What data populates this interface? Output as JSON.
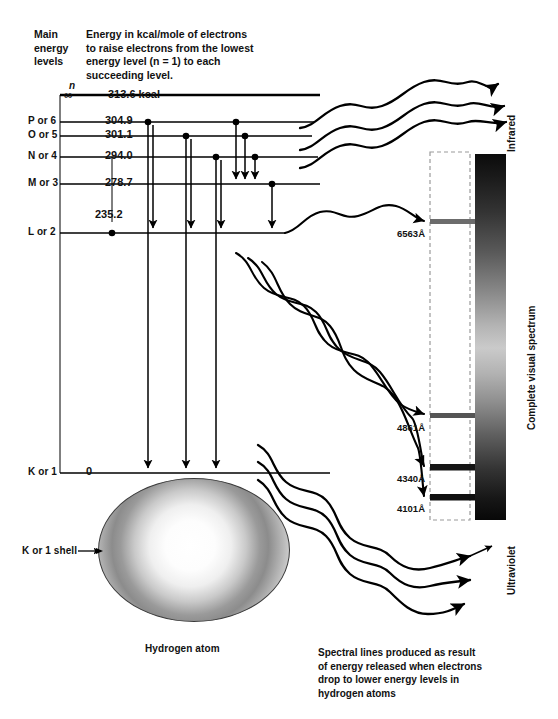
{
  "header": {
    "left_label": "Main\nenergy\nlevels",
    "left_label_lines": [
      "Main",
      "energy",
      "levels"
    ],
    "description_lines": [
      "Energy in kcal/mole of electrons",
      "to raise electrons from the lowest",
      "energy level (n = 1) to each",
      "succeeding level."
    ]
  },
  "levels": [
    {
      "id": "n-infinity",
      "name": "∞",
      "n_symbol": "n",
      "energy": "313.6 kcal",
      "y": 95
    },
    {
      "id": "p-or-6",
      "name": "P or 6",
      "energy": "304.9",
      "y": 122
    },
    {
      "id": "o-or-5",
      "name": "O or 5",
      "energy": "301.1",
      "y": 136
    },
    {
      "id": "n-or-4",
      "name": "N or 4",
      "energy": "294.0",
      "y": 157
    },
    {
      "id": "m-or-3",
      "name": "M or 3",
      "energy": "278.7",
      "y": 184
    },
    {
      "id": "l-or-2",
      "name": "L or 2",
      "energy": "235.2",
      "y": 233
    },
    {
      "id": "k-or-1",
      "name": "K or 1",
      "energy": "0",
      "y": 473
    }
  ],
  "spectral_lines": [
    {
      "label": "6563Å",
      "y": 222,
      "series": "Balmer alpha"
    },
    {
      "label": "4861Å",
      "y": 416,
      "series": "Balmer beta"
    },
    {
      "label": "4340Å",
      "y": 468,
      "series": "Balmer gamma"
    },
    {
      "label": "4101Å",
      "y": 498,
      "series": "Balmer delta"
    }
  ],
  "spectrum": {
    "top_label": "Infrared",
    "bottom_label": "Ultraviolet",
    "side_label": "Complete visual spectrum"
  },
  "atom": {
    "shell_label": "K or 1 shell",
    "caption": "Hydrogen atom"
  },
  "footer": {
    "caption_lines": [
      "Spectral lines produced as result",
      "of energy released when electrons",
      "drop to lower energy levels in",
      "hydrogen atoms"
    ]
  },
  "colors": {
    "ink": "#111111",
    "rule": "#000000",
    "dashed": "#9a9a9a",
    "spectrum_dark": "#0b0b0b",
    "spectrum_light": "#cacaca"
  }
}
